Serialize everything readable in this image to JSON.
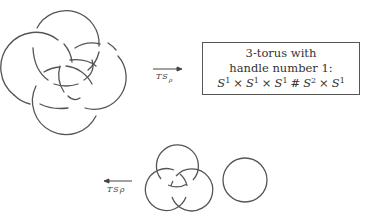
{
  "figure": {
    "top_row": {
      "knot_diagram": {
        "description": "four-component interlocked link diagram"
      },
      "arrow": {
        "direction": "right",
        "label": "TS",
        "label_subscript": "ρ"
      },
      "result_box": {
        "line1": "3-torus with",
        "line2": "handle number 1:",
        "formula": {
          "s1": "S",
          "e1": "1",
          "x1": "×",
          "s2": "S",
          "e2": "1",
          "x2": "×",
          "s3": "S",
          "e3": "1",
          "hash": "#",
          "s4": "S",
          "e4": "2",
          "x3": "×",
          "s5": "S",
          "e5": "1"
        }
      }
    },
    "bottom_row": {
      "arrow": {
        "direction": "left",
        "label": "TSρ"
      },
      "borromean_rings": {
        "description": "three interlocked circles (Borromean rings)"
      },
      "unknot": {
        "description": "separate unlinked circle"
      }
    },
    "colors": {
      "stroke": "#555555",
      "background": "#ffffff"
    }
  }
}
